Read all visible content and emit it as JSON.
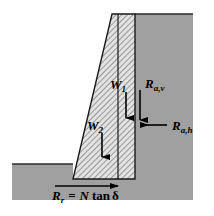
{
  "figure": {
    "background_color": "#ffffff",
    "soil_color": "#a0a0a0",
    "wall_fill_color": "#d9d9d9",
    "hatch_color": "#666666",
    "line_color": "#000000"
  },
  "labels": {
    "w1": {
      "symbol": "W",
      "subscript": "1"
    },
    "w2": {
      "symbol": "W",
      "subscript": "2"
    },
    "rav": {
      "symbol": "R",
      "subscript": "a,v"
    },
    "rah": {
      "symbol": "R",
      "subscript": "a,h"
    },
    "rr": {
      "symbol": "R",
      "subscript": "r"
    },
    "equation": {
      "equals": "=",
      "n": "N",
      "tan": "tan",
      "delta": "δ"
    }
  },
  "arrows": [
    {
      "name": "w1-arrow",
      "direction": "down",
      "label": "W1"
    },
    {
      "name": "w2-arrow",
      "direction": "down",
      "label": "W2"
    },
    {
      "name": "rav-arrow",
      "direction": "down",
      "label": "Ra,v"
    },
    {
      "name": "rah-arrow",
      "direction": "left",
      "label": "Ra,h"
    },
    {
      "name": "rr-arrow",
      "direction": "right",
      "label": "Rr"
    }
  ],
  "geometry": {
    "wall_top_y": 14,
    "wall_base_y": 179,
    "wall_top_left_x": 112,
    "wall_top_right_x": 135,
    "wall_base_left_x": 73,
    "ground_left_y": 164,
    "soil_right_x": 193,
    "soil_bottom_y": 200
  }
}
